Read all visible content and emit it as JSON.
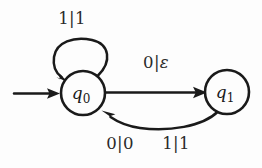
{
  "diagram": {
    "type": "finite-state-transducer",
    "background_color": "#fdfdfd",
    "stroke_color": "#1a1a1a",
    "states": [
      {
        "id": "q0",
        "label": "q",
        "subscript": "0",
        "cx": 83,
        "cy": 93,
        "r": 22,
        "is_start": true
      },
      {
        "id": "q1",
        "label": "q",
        "subscript": "1",
        "cx": 227,
        "cy": 92,
        "r": 22,
        "is_start": false
      }
    ],
    "start_arrow": {
      "name": "start-arrow",
      "from_x": 14,
      "to_x": 58,
      "y": 93
    },
    "transitions": [
      {
        "id": "self-loop-q0",
        "from": "q0",
        "to": "q0",
        "label": "1|1",
        "input": "1",
        "output": "1",
        "label_x": 72,
        "label_y": 19,
        "shape": "self-loop-above"
      },
      {
        "id": "q0-to-q1",
        "from": "q0",
        "to": "q1",
        "label": "0|ε",
        "input": "0",
        "output": "ε",
        "label_x": 156,
        "label_y": 63,
        "shape": "straight"
      },
      {
        "id": "q1-to-q0",
        "from": "q1",
        "to": "q0",
        "label": "0|0",
        "input": "0",
        "output": "0",
        "label_x": 120,
        "label_y": 144,
        "shape": "curve-below"
      },
      {
        "id": "q1-to-q0-alt",
        "from": "q1",
        "to": "q0",
        "label": "1|1",
        "input": "1",
        "output": "1",
        "label_x": 176,
        "label_y": 144,
        "shape": "curve-below-shared"
      }
    ]
  }
}
